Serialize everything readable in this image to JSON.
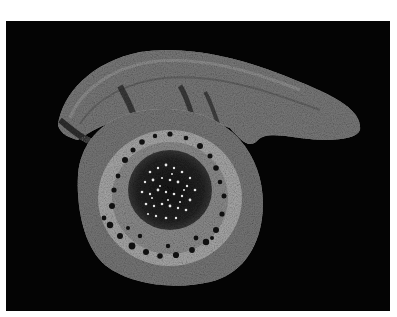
{
  "image": {
    "subject": "plant stem cross-section micrograph",
    "background_color": "#040404",
    "border_color": "#ffffff",
    "colors": {
      "tissue_outer": "#7a7a7a",
      "tissue_mid": "#8f8f8f",
      "cortex_light": "#b8b8b8",
      "pith_dark": "#1a1a1a",
      "pith_dots": "#e8e8e8",
      "vessels": "#101010"
    }
  }
}
